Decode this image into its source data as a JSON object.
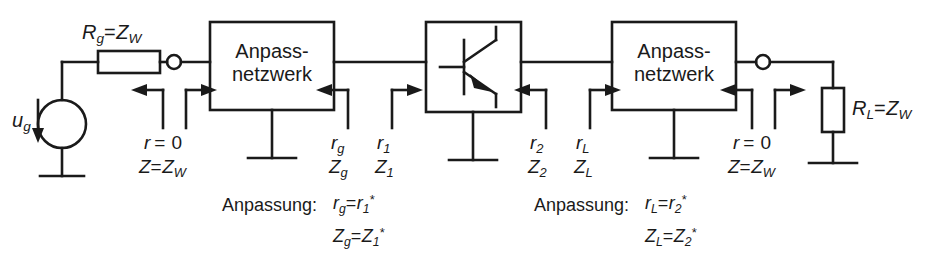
{
  "figure": {
    "type": "circuit-schematic",
    "stroke_color": "#1a1a1a",
    "background_color": "#ffffff"
  },
  "blocks": {
    "matching_network_left": {
      "line1": "Anpass-",
      "line2": "netzwerk"
    },
    "matching_network_right": {
      "line1": "Anpass-",
      "line2": "netzwerk"
    },
    "transistor": {
      "symbol": "npn-bjt"
    }
  },
  "components": {
    "source": {
      "label_u": "u",
      "label_sub": "g",
      "symbol": "voltage-source"
    },
    "series_resistor": {
      "r": "R",
      "r_sub": "g",
      "eq": "=",
      "z": "Z",
      "z_sub": "W"
    },
    "load_resistor": {
      "r": "R",
      "r_sub": "L",
      "eq": "=",
      "z": "Z",
      "z_sub": "W"
    }
  },
  "ports": {
    "input": {
      "r_sym": "r",
      "r_eq": "= 0",
      "z_sym": "Z",
      "z_eq": "=",
      "z_val": "Z",
      "z_val_sub": "W"
    },
    "output": {
      "r_sym": "r",
      "r_eq": "= 0",
      "z_sym": "Z",
      "z_eq": "=",
      "z_val": "Z",
      "z_val_sub": "W"
    }
  },
  "reflection_labels": {
    "rg": {
      "sym": "r",
      "sub": "g"
    },
    "r1": {
      "sym": "r",
      "sub": "1"
    },
    "r2": {
      "sym": "r",
      "sub": "2"
    },
    "rL": {
      "sym": "r",
      "sub": "L"
    },
    "Zg": {
      "sym": "Z",
      "sub": "g"
    },
    "Z1": {
      "sym": "Z",
      "sub": "1"
    },
    "Z2": {
      "sym": "Z",
      "sub": "2"
    },
    "ZL": {
      "sym": "Z",
      "sub": "L"
    }
  },
  "annotations": {
    "left": {
      "title": "Anpassung:",
      "line1": {
        "lhs": "r",
        "lhs_sub": "g",
        "eq": "=",
        "rhs": "r",
        "rhs_sub": "1",
        "star": "*"
      },
      "line2": {
        "lhs": "Z",
        "lhs_sub": "g",
        "eq": "=",
        "rhs": "Z",
        "rhs_sub": "1",
        "star": "*"
      }
    },
    "right": {
      "title": "Anpassung:",
      "line1": {
        "lhs": "r",
        "lhs_sub": "L",
        "eq": "=",
        "rhs": "r",
        "rhs_sub": "2",
        "star": "*"
      },
      "line2": {
        "lhs": "Z",
        "lhs_sub": "L",
        "eq": "=",
        "rhs": "Z",
        "rhs_sub": "2",
        "star": "*"
      }
    }
  }
}
